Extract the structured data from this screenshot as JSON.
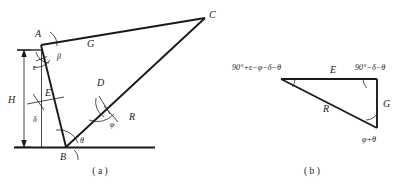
{
  "figure": {
    "title_a_caption": "( a )",
    "title_b_caption": "( b )"
  },
  "panel_a": {
    "name": "slope-geometry-diagram",
    "vertices": [
      {
        "id": "A",
        "label": "A",
        "x": 41,
        "y": 40
      },
      {
        "id": "B",
        "label": "B",
        "x": 66,
        "y": 147
      },
      {
        "id": "C",
        "label": "C",
        "x": 206,
        "y": 16
      },
      {
        "id": "D",
        "label": "D",
        "x": 104,
        "y": 88
      }
    ],
    "segments": [
      {
        "id": "G",
        "label": "G"
      },
      {
        "id": "E",
        "label": "E"
      },
      {
        "id": "R",
        "label": "R"
      },
      {
        "id": "H",
        "label": "H"
      }
    ],
    "angles": [
      {
        "id": "epsilon",
        "label": "ε"
      },
      {
        "id": "beta",
        "label": "β"
      },
      {
        "id": "delta",
        "label": "δ"
      },
      {
        "id": "theta",
        "label": "θ"
      },
      {
        "id": "phi",
        "label": "φ"
      }
    ]
  },
  "panel_b": {
    "name": "force-triangle-diagram",
    "sides": [
      {
        "id": "E",
        "label": "E"
      },
      {
        "id": "G",
        "label": "G"
      },
      {
        "id": "R",
        "label": "R"
      }
    ],
    "angles": [
      {
        "id": "apex-left",
        "label": "90°+ε−φ−δ−θ"
      },
      {
        "id": "apex-right",
        "label": "90°−δ−θ"
      },
      {
        "id": "apex-bottom",
        "label": "φ+θ"
      }
    ]
  },
  "colors": {
    "ink": "#1a1a1a",
    "background": "#ffffff"
  }
}
